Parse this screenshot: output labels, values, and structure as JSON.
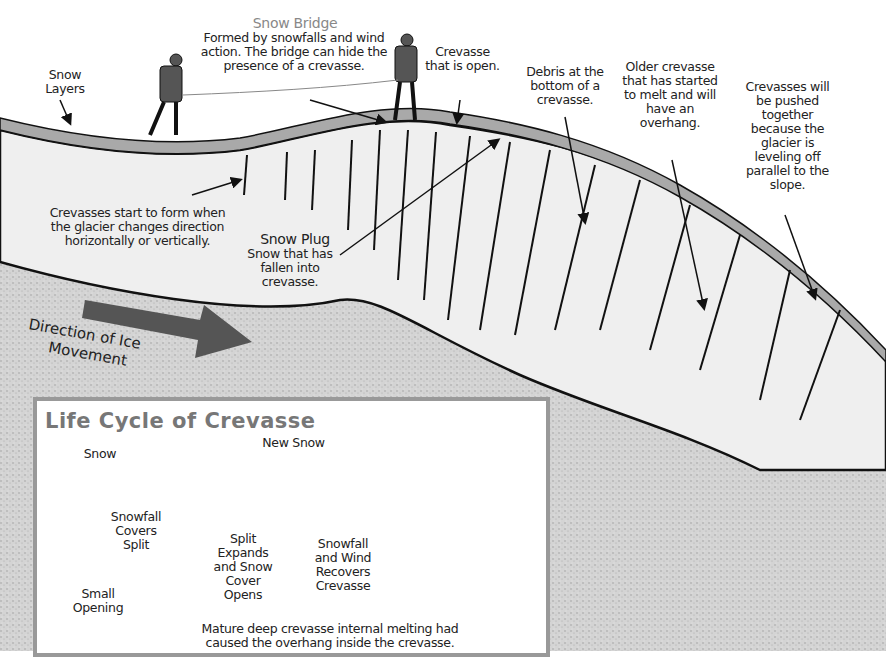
{
  "diagram": {
    "type": "glacier-crevasse-cross-section",
    "colors": {
      "background": "#ffffff",
      "ice": "#efefef",
      "bedrock": "#cfcfcf",
      "snow_layer": "#a9a9a9",
      "outline": "#1a1a1a",
      "arrow": "#555555",
      "inset_border": "#999999",
      "title_gray": "#777777"
    }
  },
  "labels": {
    "snow_layers": "Snow Layers",
    "snow_bridge_title": "Snow Bridge",
    "snow_bridge_desc": "Formed by snowfalls and wind action. The bridge can hide the presence of a crevasse.",
    "crevasse_open": "Crevasse that is open.",
    "debris": "Debris at the bottom of a crevasse.",
    "older_crevasse": "Older crevasse that has started to melt and will have an overhang.",
    "pushed_together": "Crevasses will be pushed together because the glacier is leveling off parallel to the slope.",
    "start_to_form": "Crevasses start to form when the glacier changes direction horizontally or vertically.",
    "snow_plug_title": "Snow Plug",
    "snow_plug_desc": "Snow that has fallen into crevasse.",
    "direction_line1": "Direction of Ice",
    "direction_line2": "Movement"
  },
  "inset": {
    "title": "Life Cycle of Crevasse",
    "snow": "Snow",
    "new_snow": "New Snow",
    "stages": [
      {
        "label": "Small Opening"
      },
      {
        "label": "Snowfall Covers Split"
      },
      {
        "label": "Split Expands and Snow Cover Opens"
      },
      {
        "label": "Snowfall and Wind Recovers Crevasse"
      },
      {
        "label": "Mature deep crevasse internal melting had caused the overhang inside the crevasse."
      }
    ]
  }
}
